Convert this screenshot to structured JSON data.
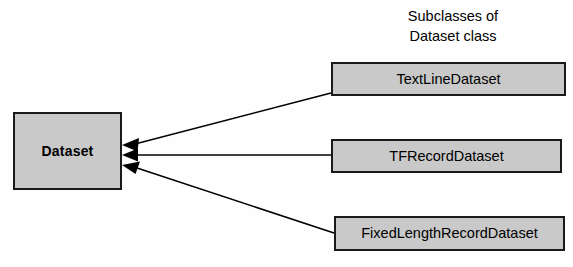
{
  "diagram": {
    "caption": {
      "line1": "Subclasses of",
      "line2": "Dataset class"
    },
    "base_node": {
      "label": "Dataset"
    },
    "subclass_nodes": [
      {
        "label": "TextLineDataset"
      },
      {
        "label": "TFRecordDataset"
      },
      {
        "label": "FixedLengthRecordDataset"
      }
    ],
    "colors": {
      "node_fill": "#c9c9c9",
      "node_border": "#1a1a1a",
      "edge": "#000000",
      "background": "#fefefe",
      "text": "#000000"
    },
    "edges": [
      {
        "from": "TextLineDataset",
        "to": "Dataset",
        "arrow": "filled-triangle"
      },
      {
        "from": "TFRecordDataset",
        "to": "Dataset",
        "arrow": "filled-triangle"
      },
      {
        "from": "FixedLengthRecordDataset",
        "to": "Dataset",
        "arrow": "filled-triangle"
      }
    ]
  }
}
